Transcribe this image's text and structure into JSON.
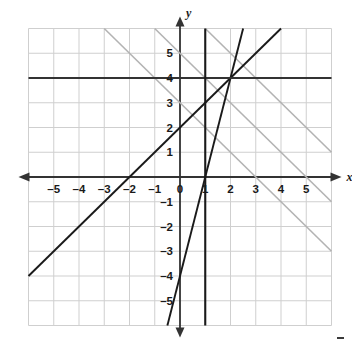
{
  "chart_data": {
    "type": "line",
    "title": "",
    "xlabel": "x",
    "ylabel": "y",
    "xlim": [
      -6,
      6
    ],
    "ylim": [
      -6,
      6
    ],
    "grid": true,
    "grid_step": 1,
    "legend": "none",
    "xticks": [
      -5,
      -4,
      -3,
      -2,
      -1,
      0,
      1,
      2,
      3,
      4,
      5
    ],
    "yticks": [
      5,
      4,
      3,
      2,
      1,
      -1,
      -2,
      -3,
      -4,
      -5
    ],
    "xtick_labels": [
      "–5",
      "–4",
      "–3",
      "–2",
      "–1",
      "0",
      "1",
      "2",
      "3",
      "4",
      "5"
    ],
    "ytick_labels": [
      "5",
      "4",
      "3",
      "2",
      "1",
      "–1",
      "–2",
      "–3",
      "–4",
      "–5"
    ],
    "axis_color": "#333333",
    "grid_color": "#cfcfcf",
    "series": [
      {
        "name": "gray-line-1",
        "equation": "y = -x + 3",
        "slope": -1,
        "intercept": 3,
        "color": "#b3b3b3",
        "width": 1.6,
        "style": "solid"
      },
      {
        "name": "gray-line-2",
        "equation": "y = -x + 5",
        "slope": -1,
        "intercept": 5,
        "color": "#b3b3b3",
        "width": 1.6,
        "style": "solid"
      },
      {
        "name": "gray-line-3",
        "equation": "y = -x + 7",
        "slope": -1,
        "intercept": 7,
        "color": "#b3b3b3",
        "width": 1.6,
        "style": "solid"
      },
      {
        "name": "dark-diagonal-line",
        "equation": "y = x + 2",
        "slope": 1,
        "intercept": 2,
        "color": "#1a1a1a",
        "width": 1.9,
        "style": "solid"
      },
      {
        "name": "steep-line",
        "equation": "y = 4x - 4",
        "slope": 4,
        "intercept": -4,
        "color": "#1a1a1a",
        "width": 1.9,
        "style": "solid"
      },
      {
        "name": "horizontal-line",
        "equation": "y = 4",
        "slope": 0,
        "intercept": 4,
        "color": "#333333",
        "width": 2.1,
        "style": "solid"
      },
      {
        "name": "vertical-line",
        "equation": "x = 1",
        "slope": null,
        "intercept": 1,
        "color": "#1a1a1a",
        "width": 2.1,
        "style": "solid"
      }
    ],
    "intersections": [
      {
        "x": 2,
        "y": 4
      },
      {
        "x": 1,
        "y": 0
      },
      {
        "x": 0,
        "y": 2
      },
      {
        "x": -2,
        "y": 0
      }
    ]
  },
  "labels": {
    "x_axis": "x",
    "y_axis": "y"
  }
}
